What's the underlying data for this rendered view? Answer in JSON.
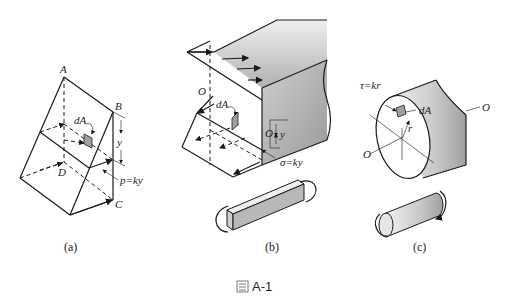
{
  "figure": {
    "caption_icon": "figure-icon",
    "caption": "A-1",
    "panels": [
      {
        "id": "a",
        "caption": "(a)",
        "labels": {
          "A": "A",
          "B": "B",
          "C": "C",
          "D": "D",
          "dA": "dA",
          "y": "y",
          "pressure": "p=ky"
        }
      },
      {
        "id": "b",
        "caption": "(b)",
        "labels": {
          "O_top": "O",
          "O_side": "O",
          "dA": "dA",
          "y": "y",
          "stress": "σ=ky"
        }
      },
      {
        "id": "c",
        "caption": "(c)",
        "labels": {
          "shear": "τ=kr",
          "dA": "dA",
          "r": "r",
          "O_left": "O",
          "O_right": "O"
        }
      }
    ]
  },
  "colors": {
    "line": "#1a1a1a",
    "shade_light": "#e4e4e4",
    "shade_dark": "#a8a8a8",
    "background": "#ffffff"
  }
}
